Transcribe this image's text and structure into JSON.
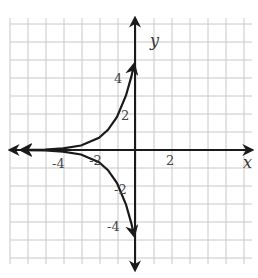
{
  "chart_data": {
    "type": "line",
    "title": "",
    "xlabel": "x",
    "ylabel": "y",
    "xlim": [
      -7,
      6.5
    ],
    "ylim": [
      -6.5,
      7
    ],
    "grid": true,
    "x_tick_labels": [
      {
        "value": -4,
        "label": "-4"
      },
      {
        "value": -2,
        "label": "-2"
      },
      {
        "value": 2,
        "label": "2"
      }
    ],
    "y_tick_labels": [
      {
        "value": 4,
        "label": "4"
      },
      {
        "value": 2,
        "label": "2"
      },
      {
        "value": -2,
        "label": "-2"
      },
      {
        "value": -4,
        "label": "-4"
      }
    ],
    "series": [
      {
        "name": "upper curve (y = 5e^x, approx.)",
        "x": [
          -6.3,
          -5,
          -4,
          -3,
          -2,
          -1.5,
          -1,
          -0.5,
          -0.2,
          -0.05
        ],
        "values": [
          0.01,
          0.03,
          0.09,
          0.25,
          0.68,
          1.12,
          1.84,
          3.03,
          4.09,
          4.76
        ],
        "arrows": "both"
      },
      {
        "name": "lower curve (y = -5e^x, approx.)",
        "x": [
          -6.3,
          -5,
          -4,
          -3,
          -2,
          -1.5,
          -1,
          -0.5,
          -0.2,
          -0.05
        ],
        "values": [
          -0.01,
          -0.03,
          -0.09,
          -0.25,
          -0.68,
          -1.12,
          -1.84,
          -3.03,
          -4.09,
          -4.76
        ],
        "arrows": "both"
      }
    ]
  },
  "labels": {
    "x_axis": "x",
    "y_axis": "y",
    "x_ticks": [
      "-4",
      "-2",
      "2"
    ],
    "y_ticks": [
      "4",
      "2",
      "-2",
      "-4"
    ]
  }
}
